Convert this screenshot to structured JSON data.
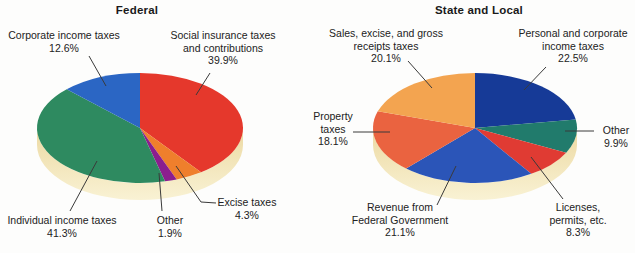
{
  "chart_data": [
    {
      "type": "pie",
      "style": "3d",
      "title": "Federal",
      "legend_position": "callout-labels",
      "start_angle_deg_from_top": 0,
      "direction": "clockwise",
      "base_color_top": "#ecd9a2",
      "base_color_bottom": "#f9f2d4",
      "slices": [
        {
          "category": "Social insurance taxes and contributions",
          "value": 39.9,
          "display": "39.9%",
          "label_lines": [
            "Social insurance taxes",
            "and contributions"
          ],
          "color": "#e5382c"
        },
        {
          "category": "Excise taxes",
          "value": 4.3,
          "display": "4.3%",
          "label_lines": [
            "Excise taxes"
          ],
          "color": "#ef7f2c"
        },
        {
          "category": "Other",
          "value": 1.9,
          "display": "1.9%",
          "label_lines": [
            "Other"
          ],
          "color": "#8b1e8e"
        },
        {
          "category": "Individual income taxes",
          "value": 41.3,
          "display": "41.3%",
          "label_lines": [
            "Individual income taxes"
          ],
          "color": "#2e8a60"
        },
        {
          "category": "Corporate income taxes",
          "value": 12.6,
          "display": "12.6%",
          "label_lines": [
            "Corporate income taxes"
          ],
          "color": "#2b66c4"
        }
      ]
    },
    {
      "type": "pie",
      "style": "3d",
      "title": "State and Local",
      "legend_position": "callout-labels",
      "start_angle_deg_from_top": 0,
      "direction": "clockwise",
      "base_color_top": "#ecd9a2",
      "base_color_bottom": "#f9f2d4",
      "slices": [
        {
          "category": "Personal and corporate income taxes",
          "value": 22.5,
          "display": "22.5%",
          "label_lines": [
            "Personal and corporate",
            "income taxes"
          ],
          "color": "#163a97"
        },
        {
          "category": "Other",
          "value": 9.9,
          "display": "9.9%",
          "label_lines": [
            "Other"
          ],
          "color": "#217b6c"
        },
        {
          "category": "Licenses, permits, etc.",
          "value": 8.3,
          "display": "8.3%",
          "label_lines": [
            "Licenses,",
            "permits, etc."
          ],
          "color": "#e03b33"
        },
        {
          "category": "Revenue from Federal Government",
          "value": 21.1,
          "display": "21.1%",
          "label_lines": [
            "Revenue from",
            "Federal Government"
          ],
          "color": "#2b55b8"
        },
        {
          "category": "Property taxes",
          "value": 18.1,
          "display": "18.1%",
          "label_lines": [
            "Property",
            "taxes"
          ],
          "color": "#ea6340"
        },
        {
          "category": "Sales, excise, and gross receipts taxes",
          "value": 20.1,
          "display": "20.1%",
          "label_lines": [
            "Sales, excise, and gross",
            "receipts taxes"
          ],
          "color": "#f3a450"
        }
      ]
    }
  ]
}
